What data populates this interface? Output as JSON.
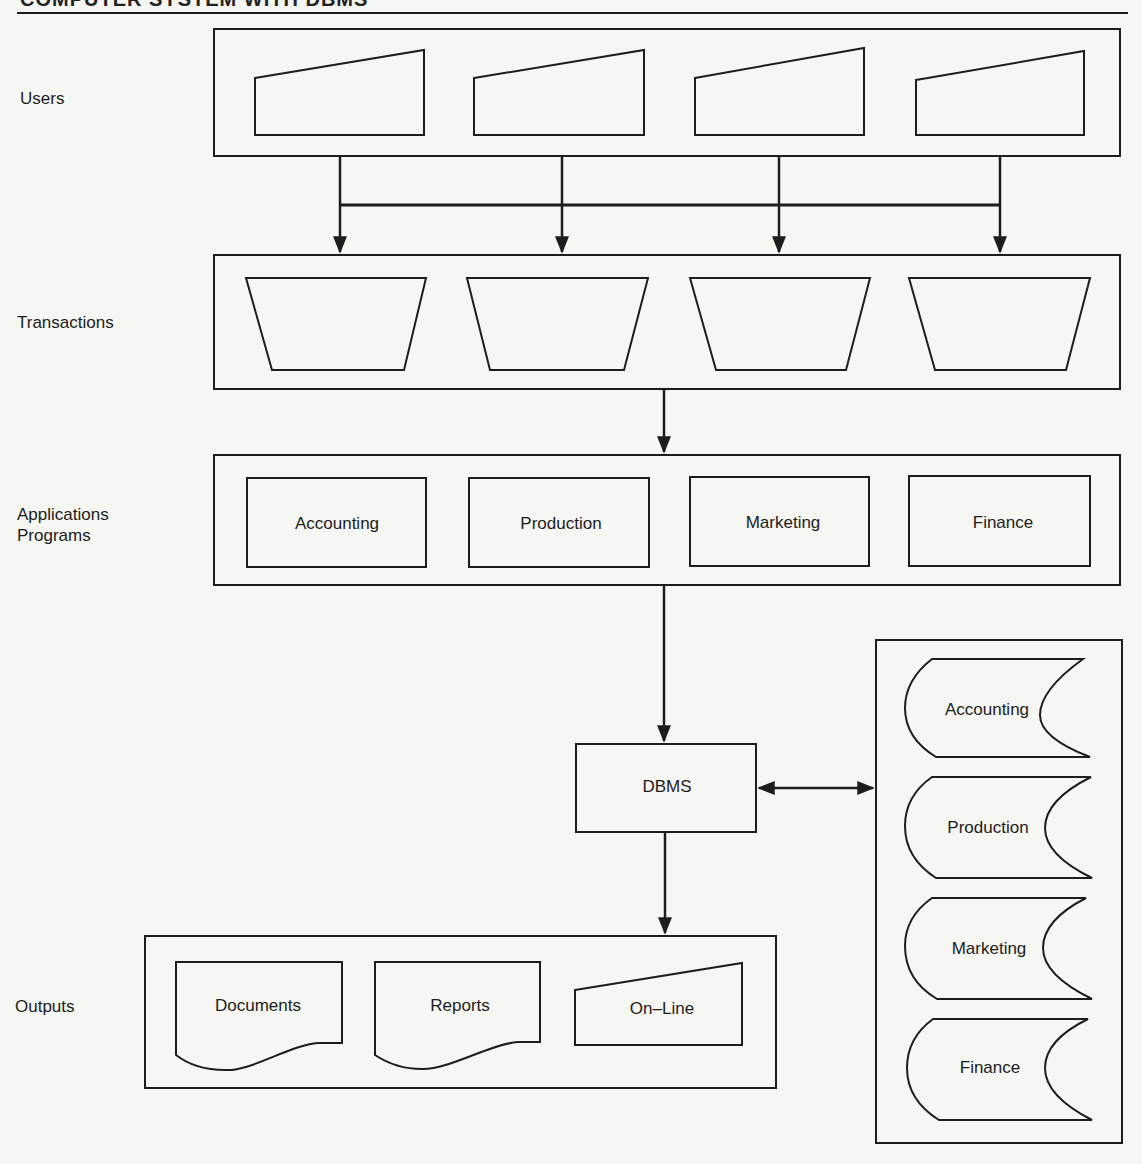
{
  "title": "COMPUTER SYSTEM WITH DBMS",
  "rows": {
    "users": {
      "label": "Users",
      "terminals": 4
    },
    "transactions": {
      "label": "Transactions",
      "items": 4
    },
    "applications": {
      "label_line1": "Applications",
      "label_line2": "Programs",
      "programs": [
        "Accounting",
        "Production",
        "Marketing",
        "Finance"
      ]
    },
    "dbms": {
      "label": "DBMS"
    },
    "databases": [
      "Accounting",
      "Production",
      "Marketing",
      "Finance"
    ],
    "outputs": {
      "label": "Outputs",
      "items": [
        "Documents",
        "Reports",
        "On–Line"
      ]
    }
  },
  "colors": {
    "background": "#f6f6f3",
    "ink": "#1d1d1d"
  }
}
